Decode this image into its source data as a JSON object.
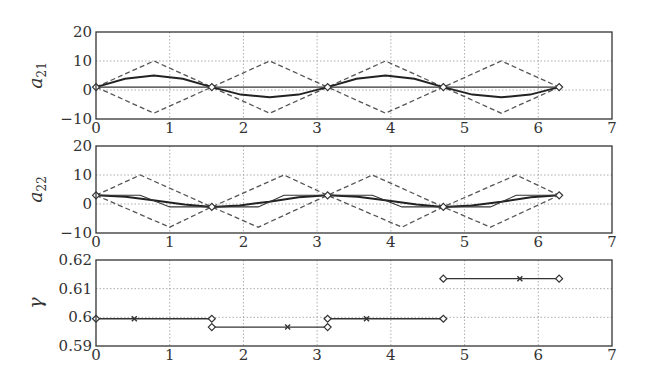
{
  "chart_data": [
    {
      "type": "line",
      "ylabel": "a_21",
      "ylabel_main": "a",
      "ylabel_sub": "21",
      "xlim": [
        0,
        7
      ],
      "ylim": [
        -10,
        20
      ],
      "xticks": [
        "0",
        "1",
        "2",
        "3",
        "4",
        "5",
        "6",
        "7"
      ],
      "yticks": [
        "20",
        "10",
        "0",
        "−10"
      ],
      "grid": true,
      "series": [
        {
          "name": "upper bound (dashed)",
          "style": "dashed",
          "x": [
            0,
            0.785,
            1.571,
            2.356,
            3.142,
            3.927,
            4.712,
            5.498,
            6.283
          ],
          "y": [
            1,
            10,
            1,
            10,
            1,
            10,
            1,
            10,
            1
          ]
        },
        {
          "name": "lower bound (dashed)",
          "style": "dashed",
          "x": [
            0,
            0.785,
            1.571,
            2.356,
            3.142,
            3.927,
            4.712,
            5.498,
            6.283
          ],
          "y": [
            1,
            -8,
            1,
            -8,
            1,
            -8,
            1,
            -8,
            1
          ]
        },
        {
          "name": "solution (solid)",
          "style": "solid",
          "x": [
            0,
            0.393,
            0.785,
            1.178,
            1.571,
            1.963,
            2.356,
            2.749,
            3.142,
            3.534,
            3.927,
            4.32,
            4.712,
            5.105,
            5.498,
            5.89,
            6.283
          ],
          "y": [
            1,
            3.9,
            5,
            3.9,
            1,
            -1.6,
            -2.5,
            -1.6,
            1,
            3.9,
            5,
            3.9,
            1,
            -1.6,
            -2.5,
            -1.6,
            1
          ]
        },
        {
          "name": "reference (flat)",
          "style": "solid",
          "x": [
            0,
            6.283
          ],
          "y": [
            1,
            1
          ]
        }
      ],
      "markers": {
        "diamond": [
          [
            0,
            1
          ],
          [
            1.571,
            1
          ],
          [
            3.142,
            1
          ],
          [
            4.712,
            1
          ],
          [
            6.283,
            1
          ]
        ]
      }
    },
    {
      "type": "line",
      "ylabel": "a_22",
      "ylabel_main": "a",
      "ylabel_sub": "22",
      "xlim": [
        0,
        7
      ],
      "ylim": [
        -10,
        20
      ],
      "xticks": [
        "0",
        "1",
        "2",
        "3",
        "4",
        "5",
        "6",
        "7"
      ],
      "yticks": [
        "20",
        "10",
        "0",
        "−10"
      ],
      "grid": true,
      "series": [
        {
          "name": "upper bound (dashed)",
          "style": "dashed",
          "x": [
            0,
            0.6,
            1.571,
            2.55,
            3.142,
            3.75,
            4.712,
            5.7,
            6.283
          ],
          "y": [
            3,
            10,
            -1,
            10,
            3,
            10,
            -1,
            10,
            3
          ]
        },
        {
          "name": "lower bound (dashed)",
          "style": "dashed",
          "x": [
            0,
            1.0,
            1.571,
            2.2,
            3.142,
            4.15,
            4.712,
            5.35,
            6.283
          ],
          "y": [
            3,
            -8,
            -1,
            -8,
            3,
            -8,
            -1,
            -8,
            3
          ]
        },
        {
          "name": "solution (solid)",
          "style": "solid",
          "x": [
            0,
            0.4,
            0.8,
            1.2,
            1.571,
            1.95,
            2.35,
            2.75,
            3.142,
            3.55,
            3.95,
            4.35,
            4.712,
            5.1,
            5.5,
            5.9,
            6.283
          ],
          "y": [
            3,
            2.5,
            1.2,
            -0.2,
            -1,
            -0.5,
            0.8,
            2.3,
            3,
            2.5,
            1.2,
            -0.2,
            -1,
            -0.5,
            0.8,
            2.3,
            3
          ]
        },
        {
          "name": "piecewise (thin)",
          "style": "solid",
          "x": [
            0,
            0.6,
            1.0,
            1.571,
            2.2,
            2.55,
            3.142,
            3.75,
            4.15,
            4.712,
            5.35,
            5.7,
            6.283
          ],
          "y": [
            3,
            3,
            -1,
            -1,
            -1,
            3,
            3,
            3,
            -1,
            -1,
            -1,
            3,
            3
          ]
        }
      ],
      "markers": {
        "diamond": [
          [
            0,
            3
          ],
          [
            1.571,
            -1
          ],
          [
            3.142,
            3
          ],
          [
            4.712,
            -1
          ],
          [
            6.283,
            3
          ]
        ]
      }
    },
    {
      "type": "line",
      "ylabel": "γ",
      "xlim": [
        0,
        7
      ],
      "ylim": [
        0.59,
        0.62
      ],
      "xticks": [
        "0",
        "1",
        "2",
        "3",
        "4",
        "5",
        "6",
        "7"
      ],
      "yticks": [
        "0.62",
        "0.61",
        "0.6",
        "0.59"
      ],
      "grid": true,
      "series": [
        {
          "name": "segment 1",
          "x": [
            0,
            1.571
          ],
          "y": [
            0.5995,
            0.5995
          ],
          "midmarker_x": 0.52
        },
        {
          "name": "segment 2",
          "x": [
            1.571,
            3.142
          ],
          "y": [
            0.5966,
            0.5966
          ],
          "midmarker_x": 2.6
        },
        {
          "name": "segment 3",
          "x": [
            3.142,
            4.712
          ],
          "y": [
            0.5995,
            0.5995
          ],
          "midmarker_x": 3.67
        },
        {
          "name": "segment 4",
          "x": [
            4.712,
            6.283
          ],
          "y": [
            0.6135,
            0.6135
          ],
          "midmarker_x": 5.75
        }
      ]
    }
  ]
}
